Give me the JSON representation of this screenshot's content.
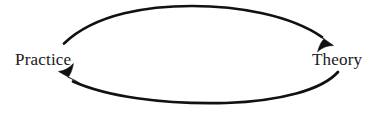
{
  "diagram": {
    "type": "cycle-diagram",
    "background_color": "#ffffff",
    "stroke_color": "#111111",
    "text_color": "#1a1a1a",
    "stroke_width": 2.6,
    "nodes": [
      {
        "id": "practice",
        "label": "Practice",
        "x": 46,
        "y": 59
      },
      {
        "id": "theory",
        "label": "Theory",
        "x": 340,
        "y": 59
      }
    ],
    "edges": [
      {
        "id": "practice-to-theory",
        "from": "practice",
        "to": "theory",
        "direction": "left-to-right",
        "position": "top",
        "arrowhead": "barbed"
      },
      {
        "id": "theory-to-practice",
        "from": "theory",
        "to": "practice",
        "direction": "right-to-left",
        "position": "bottom",
        "arrowhead": "barbed"
      }
    ]
  }
}
